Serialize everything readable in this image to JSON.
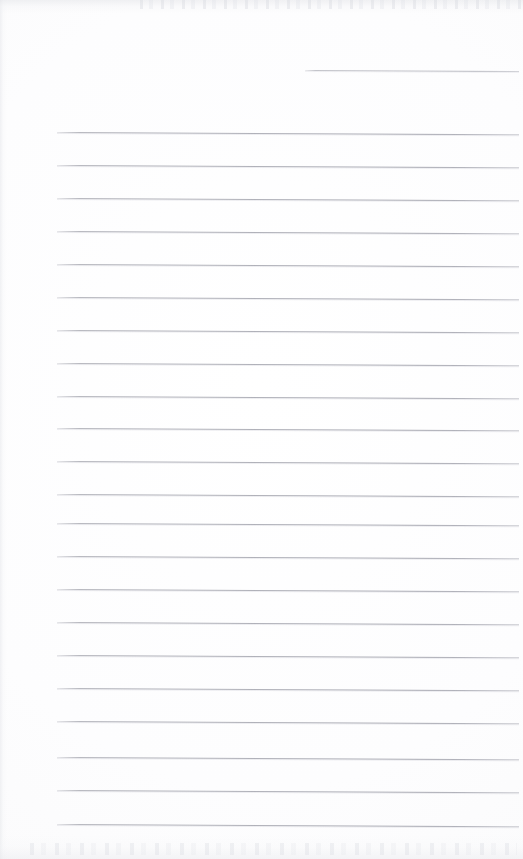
{
  "document": {
    "kind": "scanned-lined-page",
    "title": "Blank Ruled Notebook Page",
    "written_content": "",
    "page_width": 523,
    "page_height": 859,
    "background_color": "#fdfdfd",
    "rule_color": "#b0b1b8",
    "rule_thickness": 1,
    "rule_spacing": 33,
    "rule_left_margin": 57,
    "rule_right_edge": 519,
    "rule_skew_degrees": 0.28,
    "edge_artifacts": {
      "top_noise": true,
      "bottom_noise": true,
      "left_gutter": true
    }
  },
  "rules": [
    {
      "index": 0,
      "y": 70,
      "x_start": 305,
      "x_end": 519,
      "partial": true
    },
    {
      "index": 1,
      "y": 132,
      "x_start": 57,
      "x_end": 519,
      "partial": false
    },
    {
      "index": 2,
      "y": 165,
      "x_start": 57,
      "x_end": 519,
      "partial": false
    },
    {
      "index": 3,
      "y": 198,
      "x_start": 57,
      "x_end": 519,
      "partial": false
    },
    {
      "index": 4,
      "y": 231,
      "x_start": 57,
      "x_end": 519,
      "partial": false
    },
    {
      "index": 5,
      "y": 264,
      "x_start": 57,
      "x_end": 519,
      "partial": false
    },
    {
      "index": 6,
      "y": 297,
      "x_start": 57,
      "x_end": 519,
      "partial": false
    },
    {
      "index": 7,
      "y": 330,
      "x_start": 57,
      "x_end": 519,
      "partial": false
    },
    {
      "index": 8,
      "y": 363,
      "x_start": 57,
      "x_end": 519,
      "partial": false
    },
    {
      "index": 9,
      "y": 396,
      "x_start": 57,
      "x_end": 519,
      "partial": false
    },
    {
      "index": 10,
      "y": 428,
      "x_start": 57,
      "x_end": 519,
      "partial": false
    },
    {
      "index": 11,
      "y": 461,
      "x_start": 57,
      "x_end": 519,
      "partial": false
    },
    {
      "index": 12,
      "y": 494,
      "x_start": 57,
      "x_end": 519,
      "partial": false
    },
    {
      "index": 13,
      "y": 523,
      "x_start": 57,
      "x_end": 519,
      "partial": false
    },
    {
      "index": 14,
      "y": 556,
      "x_start": 57,
      "x_end": 519,
      "partial": false
    },
    {
      "index": 15,
      "y": 589,
      "x_start": 57,
      "x_end": 519,
      "partial": false
    },
    {
      "index": 16,
      "y": 622,
      "x_start": 57,
      "x_end": 519,
      "partial": false
    },
    {
      "index": 17,
      "y": 655,
      "x_start": 57,
      "x_end": 519,
      "partial": false
    },
    {
      "index": 18,
      "y": 688,
      "x_start": 57,
      "x_end": 519,
      "partial": false
    },
    {
      "index": 19,
      "y": 721,
      "x_start": 57,
      "x_end": 519,
      "partial": false
    },
    {
      "index": 20,
      "y": 757,
      "x_start": 57,
      "x_end": 519,
      "partial": false
    },
    {
      "index": 21,
      "y": 790,
      "x_start": 57,
      "x_end": 519,
      "partial": false
    },
    {
      "index": 22,
      "y": 824,
      "x_start": 57,
      "x_end": 519,
      "partial": false
    }
  ]
}
